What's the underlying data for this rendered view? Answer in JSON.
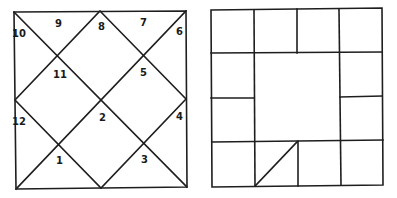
{
  "north_indian_chart": {
    "style": "diamond",
    "houses": [
      {
        "number": "1",
        "x": 56,
        "y": 164
      },
      {
        "number": "2",
        "x": 99,
        "y": 121
      },
      {
        "number": "3",
        "x": 141,
        "y": 163
      },
      {
        "number": "4",
        "x": 176,
        "y": 120
      },
      {
        "number": "5",
        "x": 140,
        "y": 76
      },
      {
        "number": "6",
        "x": 176,
        "y": 35
      },
      {
        "number": "7",
        "x": 140,
        "y": 26
      },
      {
        "number": "8",
        "x": 98,
        "y": 30
      },
      {
        "number": "9",
        "x": 55,
        "y": 27
      },
      {
        "number": "10",
        "x": 12,
        "y": 37
      },
      {
        "number": "11",
        "x": 53,
        "y": 78
      },
      {
        "number": "12",
        "x": 12,
        "y": 125
      }
    ]
  },
  "south_indian_chart": {
    "style": "grid-4x4",
    "cells": 12,
    "diagonal_cell": "bottom row, second column"
  }
}
